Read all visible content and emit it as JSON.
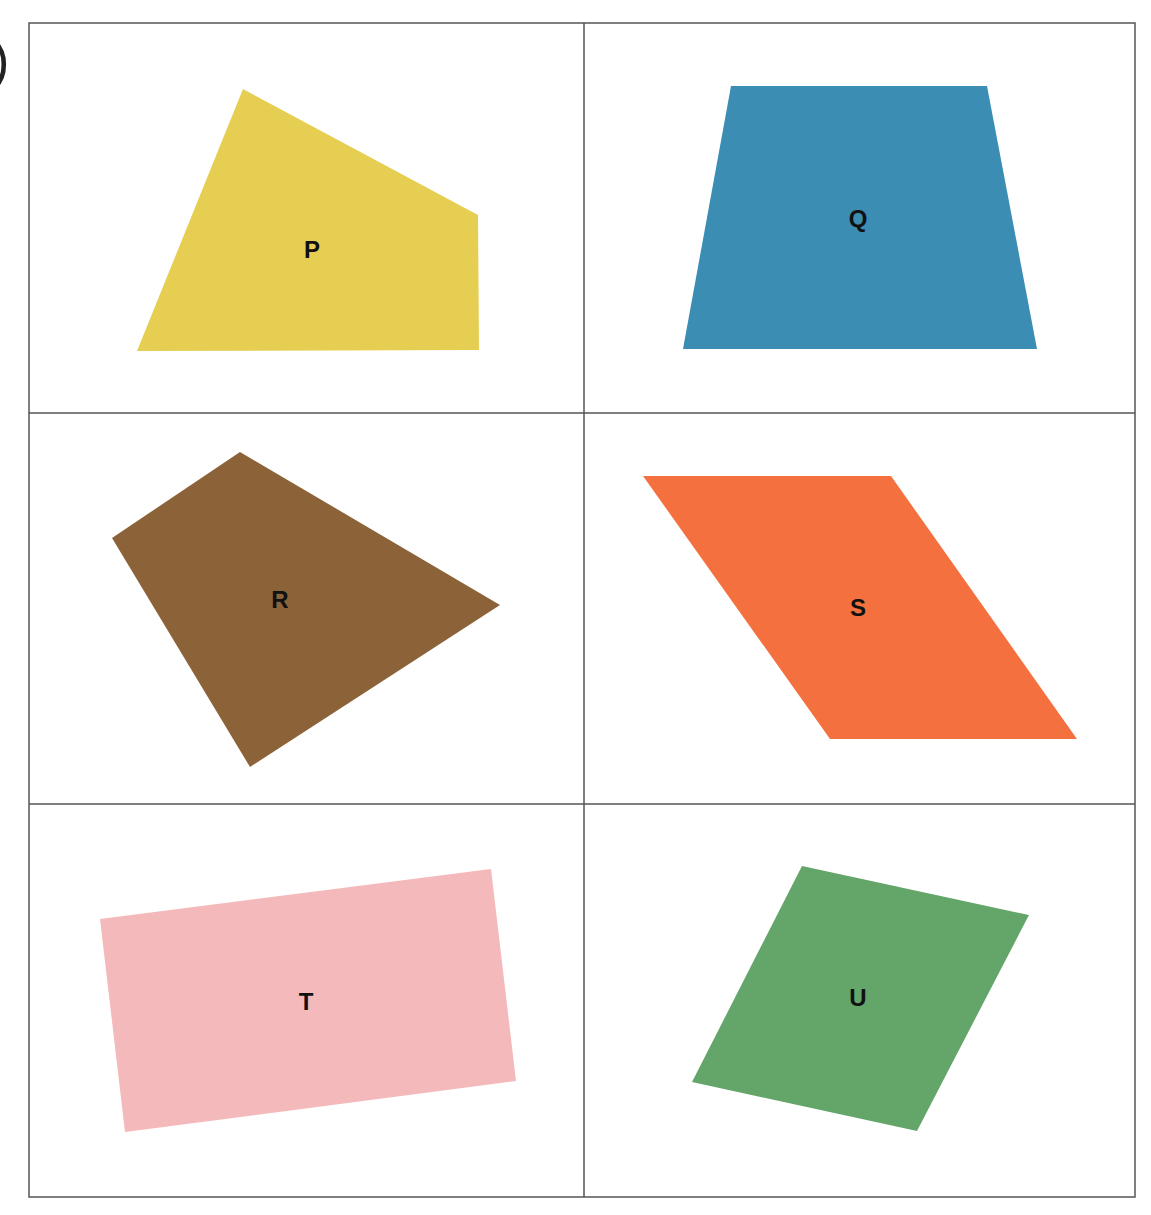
{
  "figure": {
    "edge_mark": ")",
    "grid": {
      "left": 29,
      "top": 23,
      "right": 1135,
      "bottom": 1197,
      "col_split": 584,
      "row_splits": [
        413,
        804
      ],
      "line_color": "#555555"
    },
    "shapes": [
      {
        "id": "P",
        "label": "P",
        "color": "#E5CE52",
        "points": "243,89 478,215 479,350 137,351",
        "label_pos": [
          312,
          252
        ]
      },
      {
        "id": "Q",
        "label": "Q",
        "color": "#3B8DB4",
        "points": "731,86 987,86 1037,349 683,349",
        "label_pos": [
          858,
          221
        ]
      },
      {
        "id": "R",
        "label": "R",
        "color": "#8C6238",
        "points": "240,452 500,605 250,767 112,538",
        "label_pos": [
          280,
          602
        ]
      },
      {
        "id": "S",
        "label": "S",
        "color": "#F5703F",
        "points": "643,476 891,476 1077,739 830,739",
        "label_pos": [
          858,
          610
        ]
      },
      {
        "id": "T",
        "label": "T",
        "color": "#F4B9BA",
        "points": "100,919 491,869 516,1081 125,1132",
        "label_pos": [
          306,
          1004
        ]
      },
      {
        "id": "U",
        "label": "U",
        "color": "#64A56A",
        "points": "802,866 1029,915 917,1131 692,1082",
        "label_pos": [
          858,
          1000
        ]
      }
    ]
  }
}
